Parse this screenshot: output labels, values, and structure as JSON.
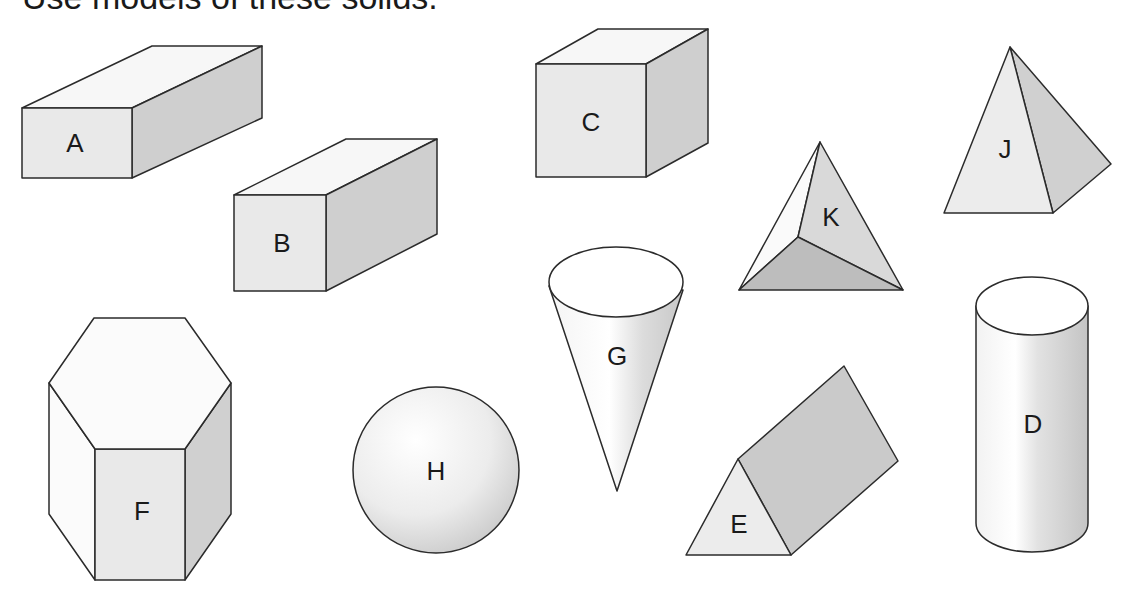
{
  "title": "Use models of these solids.",
  "colors": {
    "front_face": "#e9e9e9",
    "top_face": "#f7f7f7",
    "side_face": "#cfcfcf",
    "dark_face": "#bdbdbd",
    "edge": "#2b2b2b",
    "label": "#1a1a1a"
  },
  "solids": [
    {
      "id": "A",
      "label": "A",
      "shape": "rectangular prism (long)"
    },
    {
      "id": "B",
      "label": "B",
      "shape": "rectangular prism"
    },
    {
      "id": "C",
      "label": "C",
      "shape": "cube"
    },
    {
      "id": "D",
      "label": "D",
      "shape": "cylinder"
    },
    {
      "id": "E",
      "label": "E",
      "shape": "triangular prism"
    },
    {
      "id": "F",
      "label": "F",
      "shape": "hexagonal prism"
    },
    {
      "id": "G",
      "label": "G",
      "shape": "cone"
    },
    {
      "id": "H",
      "label": "H",
      "shape": "sphere"
    },
    {
      "id": "J",
      "label": "J",
      "shape": "square pyramid"
    },
    {
      "id": "K",
      "label": "K",
      "shape": "triangular pyramid"
    }
  ]
}
